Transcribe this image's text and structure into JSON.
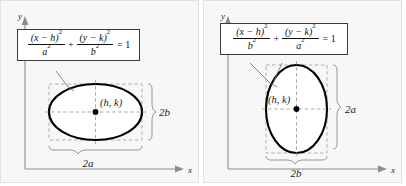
{
  "figure": {
    "background_color": "#f7f7f7",
    "curve_color": "#000000",
    "guide_color": "#9a9a9a",
    "box_border_color": "#3a3a3a"
  },
  "panels": [
    {
      "id": "horizontal-major-axis",
      "axes": {
        "x_label": "x",
        "y_label": "y"
      },
      "equation": {
        "term1_num": "(x − h)",
        "term1_num_exp": "2",
        "term1_den": "a",
        "term1_den_exp": "2",
        "operator": "+",
        "term2_num": "(y − k)",
        "term2_num_exp": "2",
        "term2_den": "b",
        "term2_den_exp": "2",
        "equals": "= 1"
      },
      "center_label": "(h, k)",
      "width_label": "2a",
      "height_label": "2b",
      "orientation": "horizontal"
    },
    {
      "id": "vertical-major-axis",
      "axes": {
        "x_label": "x",
        "y_label": "y"
      },
      "equation": {
        "term1_num": "(x − h)",
        "term1_num_exp": "2",
        "term1_den": "b",
        "term1_den_exp": "2",
        "operator": "+",
        "term2_num": "(y − k)",
        "term2_num_exp": "2",
        "term2_den": "a",
        "term2_den_exp": "2",
        "equals": "= 1"
      },
      "center_label": "(h, k)",
      "width_label": "2b",
      "height_label": "2a",
      "orientation": "vertical"
    }
  ]
}
